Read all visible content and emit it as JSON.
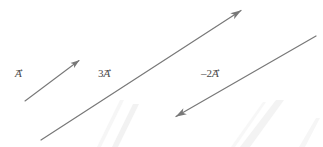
{
  "figure": {
    "background_color": "#ffffff",
    "width": 323,
    "height": 147,
    "stroke_color": "#787878",
    "label_color": "#4a4a4a",
    "watermark_color": "#f4f4f4"
  },
  "vectors": [
    {
      "id": "vector-a",
      "label": "A",
      "coefficient": "",
      "label_full": "A⃗",
      "has_vector_arrow": true,
      "direction": "up-right",
      "arrowhead_at": "end",
      "start": {
        "x": 25,
        "y": 101
      },
      "end": {
        "x": 82,
        "y": 58
      },
      "length_px": 71,
      "angle_deg": -37
    },
    {
      "id": "vector-3a",
      "label": "A",
      "coefficient": "3",
      "label_full": "3A⃗",
      "has_vector_arrow": true,
      "direction": "up-right",
      "arrowhead_at": "end",
      "start": {
        "x": 41,
        "y": 140
      },
      "end": {
        "x": 245,
        "y": 8
      },
      "length_px": 243,
      "angle_deg": -33
    },
    {
      "id": "vector-minus2a",
      "label": "A",
      "coefficient": "–2",
      "label_full": "–2A⃗",
      "has_vector_arrow": true,
      "direction": "down-left",
      "arrowhead_at": "start",
      "start": {
        "x": 316,
        "y": 36
      },
      "end": {
        "x": 172,
        "y": 119
      },
      "length_px": 166,
      "angle_deg": 150
    }
  ],
  "labels": {
    "a": {
      "coef": "",
      "sym": "A",
      "arrow": "→"
    },
    "three_a": {
      "coef": "3",
      "sym": "A",
      "arrow": "→"
    },
    "minus_two_a": {
      "coef": "–2",
      "sym": "A",
      "arrow": "→"
    }
  }
}
